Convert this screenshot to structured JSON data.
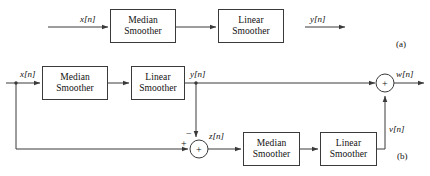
{
  "figure": {
    "caption_a": "(a)",
    "caption_b": "(b)"
  },
  "diagram_a": {
    "input_label": "x[n]",
    "output_label": "y[n]",
    "blocks": [
      {
        "line1": "Median",
        "line2": "Smoother"
      },
      {
        "line1": "Linear",
        "line2": "Smoother"
      }
    ]
  },
  "diagram_b": {
    "input_label": "x[n]",
    "mid_label": "y[n]",
    "error_label": "z[n]",
    "correction_label": "v[n]",
    "output_label": "w[n]",
    "sum_symbol_top": "+",
    "sum_symbol_bottom": "+",
    "sign_negative": "−",
    "sign_positive": "+",
    "blocks": [
      {
        "line1": "Median",
        "line2": "Smoother"
      },
      {
        "line1": "Linear",
        "line2": "Smoother"
      },
      {
        "line1": "Median",
        "line2": "Smoother"
      },
      {
        "line1": "Linear",
        "line2": "Smoother"
      }
    ]
  },
  "style": {
    "line_color": "#3a3a3a",
    "text_color": "#111111",
    "background": "#ffffff"
  }
}
